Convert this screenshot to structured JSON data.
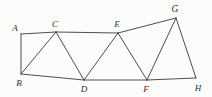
{
  "figure": {
    "background_color": "#fcfcfb",
    "stroke_color": "#3a3a3c",
    "label_color": "#2f2f31",
    "width": 212,
    "height": 97
  },
  "chart_data": {
    "type": "diagram",
    "xlabel": "",
    "ylabel": "",
    "xlim": [
      0,
      212
    ],
    "ylim": [
      0,
      97
    ],
    "grid": false,
    "legend": "none",
    "vertices": [
      {
        "name": "A",
        "x": 21,
        "y": 34,
        "label_x": 15,
        "label_y": 28
      },
      {
        "name": "B",
        "x": 21,
        "y": 74,
        "label_x": 19,
        "label_y": 83
      },
      {
        "name": "C",
        "x": 56,
        "y": 32,
        "label_x": 55,
        "label_y": 24
      },
      {
        "name": "D",
        "x": 84,
        "y": 80,
        "label_x": 84,
        "label_y": 89
      },
      {
        "name": "E",
        "x": 118,
        "y": 33,
        "label_x": 117,
        "label_y": 24
      },
      {
        "name": "F",
        "x": 147,
        "y": 80,
        "label_x": 146,
        "label_y": 89
      },
      {
        "name": "G",
        "x": 176,
        "y": 18,
        "label_x": 175,
        "label_y": 9
      },
      {
        "name": "H",
        "x": 196,
        "y": 78,
        "label_x": 198,
        "label_y": 88
      }
    ],
    "edges": [
      {
        "from": "A",
        "to": "B"
      },
      {
        "from": "A",
        "to": "C"
      },
      {
        "from": "B",
        "to": "C"
      },
      {
        "from": "B",
        "to": "D"
      },
      {
        "from": "C",
        "to": "D"
      },
      {
        "from": "C",
        "to": "E"
      },
      {
        "from": "D",
        "to": "E"
      },
      {
        "from": "D",
        "to": "F"
      },
      {
        "from": "E",
        "to": "F"
      },
      {
        "from": "E",
        "to": "G"
      },
      {
        "from": "F",
        "to": "G"
      },
      {
        "from": "F",
        "to": "H"
      },
      {
        "from": "G",
        "to": "H"
      }
    ]
  }
}
